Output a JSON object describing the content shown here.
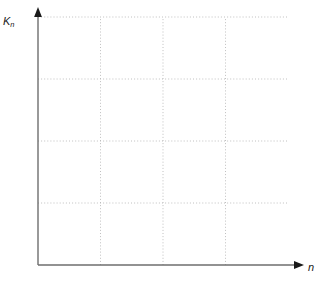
{
  "chart_data": {
    "type": "line",
    "title": "",
    "xlabel": "Anzahl der Zinsperioden n",
    "ylabel": "K",
    "ylabel_sub": "n",
    "xlabel_axis": "n",
    "x": [
      0,
      1,
      2,
      3,
      4,
      5,
      6,
      7,
      8,
      9,
      10,
      11,
      12,
      13,
      14,
      15,
      16,
      17,
      18,
      19,
      20
    ],
    "xlim": [
      0,
      20
    ],
    "ylim": [
      0,
      20
    ],
    "xticks": [
      0,
      5,
      10,
      15,
      20
    ],
    "yticks": [
      0,
      5,
      10,
      15,
      20
    ],
    "xtick_labels": [
      "0",
      "5",
      "10",
      "15",
      "20"
    ],
    "ytick_labels": [
      "0",
      "5",
      "10",
      "15",
      "20"
    ],
    "xtick_minor_step": 1,
    "ytick_minor_step": 1,
    "grid": "dotted-gray",
    "grid_x": [
      5,
      10,
      15
    ],
    "grid_y": [
      5,
      10,
      15,
      20
    ],
    "legend_position": "right-of-curve-ends",
    "curve_color": "#111111",
    "grid_color": "#b9b9b9",
    "axis_color": "#6e6e6e",
    "formula": "K_n = K_0 (1 + p/100)^n, K_0 = 1",
    "series": [
      {
        "name": "p = 15",
        "label_p": "p",
        "label_eq": "=",
        "label_value": "15",
        "rate_percent": 15,
        "values": [
          1,
          1.15,
          1.32,
          1.52,
          1.75,
          2.01,
          2.31,
          2.66,
          3.06,
          3.52,
          4.05,
          4.65,
          5.35,
          6.15,
          7.08,
          8.14,
          9.36,
          10.76,
          12.38,
          14.23,
          16.37
        ]
      },
      {
        "name": "p = 12",
        "label_p": "p",
        "label_eq": "=",
        "label_value": "12",
        "rate_percent": 12,
        "values": [
          1,
          1.12,
          1.25,
          1.4,
          1.57,
          1.76,
          1.97,
          2.21,
          2.48,
          2.77,
          3.11,
          3.48,
          3.9,
          4.36,
          4.89,
          5.47,
          6.13,
          6.87,
          7.69,
          8.61,
          9.65
        ]
      },
      {
        "name": "p = 9",
        "label_p": "p",
        "label_eq": "=",
        "label_value": "9",
        "rate_percent": 9,
        "values": [
          1,
          1.09,
          1.19,
          1.3,
          1.41,
          1.54,
          1.68,
          1.83,
          1.99,
          2.17,
          2.37,
          2.58,
          2.81,
          3.07,
          3.34,
          3.64,
          3.97,
          4.33,
          4.72,
          5.14,
          5.6
        ]
      },
      {
        "name": "p = 6",
        "label_p": "p",
        "label_eq": "=",
        "label_value": "6",
        "rate_percent": 6,
        "values": [
          1,
          1.06,
          1.12,
          1.19,
          1.26,
          1.34,
          1.42,
          1.5,
          1.59,
          1.69,
          1.79,
          1.9,
          2.01,
          2.13,
          2.26,
          2.4,
          2.54,
          2.69,
          2.85,
          3.03,
          3.21
        ]
      },
      {
        "name": "p = 3",
        "label_p": "p",
        "label_eq": "=",
        "label_value": "3",
        "rate_percent": 3,
        "values": [
          1,
          1.03,
          1.06,
          1.09,
          1.13,
          1.16,
          1.19,
          1.23,
          1.27,
          1.3,
          1.34,
          1.38,
          1.43,
          1.47,
          1.51,
          1.56,
          1.6,
          1.65,
          1.7,
          1.75,
          1.81
        ]
      }
    ]
  }
}
